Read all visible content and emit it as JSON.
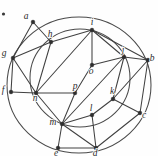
{
  "figure": {
    "width": 158,
    "height": 156,
    "background_color": "#fefefe",
    "stroke_color": "#404040",
    "vertex_color": "#2e2e2e"
  },
  "circles": [
    {
      "name": "outer-circle",
      "cx": 79,
      "cy": 85,
      "rx": 72,
      "ry": 68
    },
    {
      "name": "inner-circle",
      "cx": 80,
      "cy": 78,
      "rx": 50,
      "ry": 49
    }
  ],
  "stray_dot": {
    "name": "stray-dot",
    "cx": 3.5,
    "cy": 14,
    "r": 1.6
  },
  "chart_data": {
    "type": "graph",
    "vertex_count": 16,
    "edge_count": 30,
    "nodes": [
      {
        "id": "a",
        "label": "a",
        "x": 33,
        "y": 22,
        "ring": "outer",
        "label_dx": -7,
        "label_dy": -3
      },
      {
        "id": "b",
        "label": "b",
        "x": 148,
        "y": 60,
        "ring": "outer",
        "label_dx": 4,
        "label_dy": 1
      },
      {
        "id": "c",
        "label": "c",
        "x": 140,
        "y": 113,
        "ring": "outer",
        "label_dx": 4,
        "label_dy": 5
      },
      {
        "id": "d",
        "label": "d",
        "x": 96,
        "y": 148,
        "ring": "outer",
        "label_dx": -1,
        "label_dy": 8
      },
      {
        "id": "e",
        "label": "e",
        "x": 58,
        "y": 148,
        "ring": "outer",
        "label_dx": -2,
        "label_dy": 8
      },
      {
        "id": "f",
        "label": "f",
        "x": 11,
        "y": 92,
        "ring": "outer",
        "label_dx": -8,
        "label_dy": 1
      },
      {
        "id": "g",
        "label": "g",
        "x": 13,
        "y": 58,
        "ring": "outer",
        "label_dx": -9,
        "label_dy": -2
      },
      {
        "id": "h",
        "label": "h",
        "x": 51,
        "y": 42,
        "ring": "inner",
        "label_dx": -1,
        "label_dy": -5
      },
      {
        "id": "i",
        "label": "i",
        "x": 92,
        "y": 30,
        "ring": "inner",
        "label_dx": 0,
        "label_dy": -5
      },
      {
        "id": "j",
        "label": "j",
        "x": 124,
        "y": 57,
        "ring": "inner",
        "label_dx": -1,
        "label_dy": -4
      },
      {
        "id": "k",
        "label": "k",
        "x": 113,
        "y": 99,
        "ring": "inner",
        "label_dx": -1,
        "label_dy": -5
      },
      {
        "id": "l",
        "label": "l",
        "x": 92,
        "y": 115,
        "ring": "inner",
        "label_dx": -1,
        "label_dy": -4
      },
      {
        "id": "m",
        "label": "m",
        "x": 62,
        "y": 124,
        "ring": "inner",
        "label_dx": -9,
        "label_dy": 1
      },
      {
        "id": "n",
        "label": "n",
        "x": 36,
        "y": 93,
        "ring": "inner",
        "label_dx": -1,
        "label_dy": 8
      },
      {
        "id": "o",
        "label": "o",
        "x": 92,
        "y": 65,
        "ring": "center",
        "label_dx": -1,
        "label_dy": 9
      },
      {
        "id": "p",
        "label": "p",
        "x": 75,
        "y": 93,
        "ring": "center",
        "label_dx": 0,
        "label_dy": -4
      }
    ],
    "edges": [
      {
        "from": "a",
        "to": "h"
      },
      {
        "from": "a",
        "to": "g"
      },
      {
        "from": "g",
        "to": "h"
      },
      {
        "from": "g",
        "to": "n"
      },
      {
        "from": "g",
        "to": "f"
      },
      {
        "from": "f",
        "to": "n"
      },
      {
        "from": "h",
        "to": "n"
      },
      {
        "from": "h",
        "to": "i"
      },
      {
        "from": "n",
        "to": "i"
      },
      {
        "from": "n",
        "to": "p"
      },
      {
        "from": "n",
        "to": "m"
      },
      {
        "from": "i",
        "to": "o"
      },
      {
        "from": "i",
        "to": "j"
      },
      {
        "from": "i",
        "to": "b"
      },
      {
        "from": "j",
        "to": "b"
      },
      {
        "from": "j",
        "to": "o"
      },
      {
        "from": "j",
        "to": "k"
      },
      {
        "from": "j",
        "to": "m"
      },
      {
        "from": "b",
        "to": "k"
      },
      {
        "from": "b",
        "to": "c"
      },
      {
        "from": "k",
        "to": "c"
      },
      {
        "from": "k",
        "to": "l"
      },
      {
        "from": "c",
        "to": "d"
      },
      {
        "from": "l",
        "to": "m"
      },
      {
        "from": "l",
        "to": "d"
      },
      {
        "from": "m",
        "to": "e"
      },
      {
        "from": "m",
        "to": "d"
      },
      {
        "from": "e",
        "to": "d"
      },
      {
        "from": "o",
        "to": "p"
      },
      {
        "from": "p",
        "to": "m"
      }
    ],
    "arcs": [
      {
        "from": "a",
        "to": "b",
        "ring": "outer"
      },
      {
        "from": "a",
        "to": "g",
        "ring": "outer"
      },
      {
        "from": "g",
        "to": "f",
        "ring": "outer"
      },
      {
        "from": "f",
        "to": "e",
        "ring": "outer"
      },
      {
        "from": "e",
        "to": "d",
        "ring": "outer"
      },
      {
        "from": "d",
        "to": "c",
        "ring": "outer"
      },
      {
        "from": "c",
        "to": "b",
        "ring": "outer"
      },
      {
        "from": "h",
        "to": "i",
        "ring": "inner"
      },
      {
        "from": "i",
        "to": "j",
        "ring": "inner"
      },
      {
        "from": "j",
        "to": "k",
        "ring": "inner"
      },
      {
        "from": "k",
        "to": "l",
        "ring": "inner"
      },
      {
        "from": "l",
        "to": "m",
        "ring": "inner"
      },
      {
        "from": "m",
        "to": "n",
        "ring": "inner"
      },
      {
        "from": "n",
        "to": "h",
        "ring": "inner"
      }
    ],
    "xlabel": "",
    "ylabel": "",
    "legend": []
  }
}
